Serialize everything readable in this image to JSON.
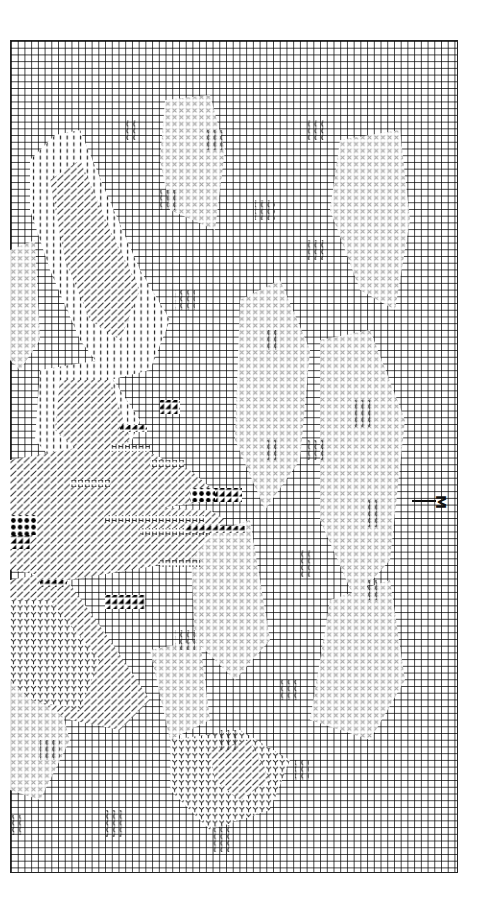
{
  "chart": {
    "type": "cross-stitch-pattern",
    "grid": {
      "columns": 67,
      "rows": 124,
      "cell_px": 6.72,
      "line_color": "#000000",
      "background": "#ffffff"
    },
    "center_marker": {
      "label": "M",
      "side": "right",
      "row": 69
    }
  },
  "symbols": [
    {
      "name": "light-cross",
      "meaning": "pale stitch (background flowers)",
      "color": "#9a9a9a"
    },
    {
      "name": "vertical-bar",
      "meaning": "medium stitch (body)",
      "color": "#333333"
    },
    {
      "name": "diagonal-hatch",
      "meaning": "shaded stitch",
      "color": "#333333"
    },
    {
      "name": "y-outline",
      "meaning": "outline stitch",
      "color": "#222222"
    },
    {
      "name": "H",
      "meaning": "H stitch (feather detail)",
      "color": "#222222"
    },
    {
      "name": "filled-triangle",
      "meaning": "dark half stitch",
      "color": "#000000"
    },
    {
      "name": "filled-dot",
      "meaning": "dark full stitch",
      "color": "#000000"
    },
    {
      "name": "wave",
      "meaning": "water ripple stitch",
      "color": "#222222"
    }
  ]
}
